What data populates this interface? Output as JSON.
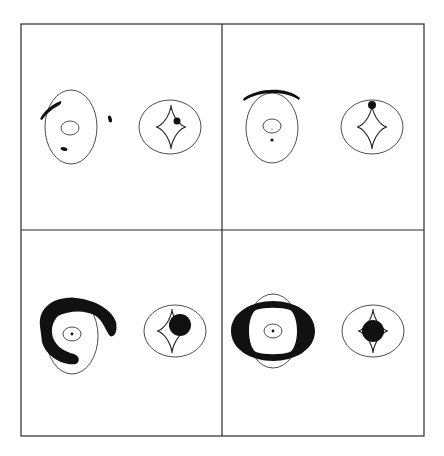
{
  "figure": {
    "type": "lensing-diagram-grid",
    "layout": {
      "rows": 2,
      "cols": 2
    },
    "colors": {
      "ink": "#111111",
      "line": "#3a3a3a",
      "background": "#ffffff"
    },
    "frame": {
      "x": 21,
      "y": 24,
      "width": 403,
      "height": 412,
      "divider_x": 222,
      "divider_y": 230
    },
    "panels": [
      {
        "id": "top-left",
        "image_plane": {
          "critical_curve": {
            "cx": 71,
            "cy": 127,
            "rx": 26,
            "ry": 37
          },
          "inner_curve": {
            "cx": 70,
            "cy": 128,
            "rx": 9,
            "ry": 7
          },
          "images": [
            {
              "shape": "arc",
              "path": "M40,119 C44,111 52,104 61,101 C62,103 60,105 58,106 C52,109 46,114 42,120 Z"
            },
            {
              "shape": "blob",
              "cx": 110,
              "cy": 119,
              "rx": 1.8,
              "ry": 3.5,
              "rotate": -15
            },
            {
              "shape": "blob",
              "cx": 64,
              "cy": 149,
              "rx": 3.5,
              "ry": 1.8,
              "rotate": 15
            }
          ]
        },
        "source_plane": {
          "caustic_ellipse": {
            "cx": 170,
            "cy": 127,
            "rx": 31,
            "ry": 27
          },
          "astroid": {
            "cx": 171,
            "cy": 127,
            "hx": 15,
            "hy": 22
          },
          "source": {
            "cx": 177,
            "cy": 121,
            "r": 3.5
          }
        }
      },
      {
        "id": "top-right",
        "image_plane": {
          "critical_curve": {
            "cx": 272,
            "cy": 128,
            "rx": 26,
            "ry": 35
          },
          "inner_curve": {
            "cx": 272,
            "cy": 126,
            "rx": 9,
            "ry": 7
          },
          "images": [
            {
              "shape": "arc",
              "path": "M243,99 C256,88 286,86 300,98 L299,100 C285,90 258,91 244,101 Z"
            },
            {
              "shape": "blob",
              "cx": 272,
              "cy": 140,
              "rx": 1.6,
              "ry": 1.6,
              "rotate": 0
            },
            {
              "shape": "blob",
              "cx": 272,
              "cy": 129,
              "rx": 0.6,
              "ry": 0.6,
              "rotate": 0
            }
          ]
        },
        "source_plane": {
          "caustic_ellipse": {
            "cx": 372,
            "cy": 127,
            "rx": 31,
            "ry": 27
          },
          "astroid": {
            "cx": 372,
            "cy": 127,
            "hx": 15,
            "hy": 22
          },
          "source": {
            "cx": 372,
            "cy": 105,
            "r": 4
          }
        }
      },
      {
        "id": "bottom-left",
        "image_plane": {
          "critical_curve": {
            "cx": 72,
            "cy": 336,
            "rx": 26,
            "ry": 38
          },
          "inner_curve": {
            "cx": 72,
            "cy": 334,
            "rx": 9,
            "ry": 7
          },
          "images": [
            {
              "shape": "band",
              "path": "M40,326 C38,306 56,296 76,298 C96,300 112,310 116,322 C118,332 114,338 110,336 C106,332 104,322 96,316 C86,310 70,310 58,316 C52,322 50,332 54,340 C58,348 66,352 74,354 C80,356 80,362 76,364 C62,366 46,356 42,342 Z"
            },
            {
              "shape": "blob",
              "cx": 72,
              "cy": 334,
              "rx": 1.4,
              "ry": 1.4,
              "rotate": 0
            }
          ]
        },
        "source_plane": {
          "caustic_ellipse": {
            "cx": 175,
            "cy": 331,
            "rx": 31,
            "ry": 26
          },
          "astroid": {
            "cx": 172,
            "cy": 331,
            "hx": 15,
            "hy": 22
          },
          "source": {
            "cx": 180,
            "cy": 325,
            "r": 11
          }
        }
      },
      {
        "id": "bottom-right",
        "image_plane": {
          "critical_curve": {
            "cx": 273,
            "cy": 331,
            "rx": 26,
            "ry": 37
          },
          "inner_curve": {
            "cx": 273,
            "cy": 331,
            "rx": 9,
            "ry": 7
          },
          "images": [
            {
              "shape": "ring",
              "path": "M231,331 C231,312 252,301 273,301 C294,301 315,312 315,331 C315,350 294,361 273,361 C252,361 231,350 231,331 Z M249,331 C249,341 252,350 256,352 C264,355 282,355 290,352 C294,350 297,341 297,331 C297,321 294,312 290,310 C282,307 264,307 256,310 C252,312 249,321 249,331 Z"
            },
            {
              "shape": "blob",
              "cx": 273,
              "cy": 331,
              "rx": 1.4,
              "ry": 1.4,
              "rotate": 0
            }
          ]
        },
        "source_plane": {
          "caustic_ellipse": {
            "cx": 373,
            "cy": 331,
            "rx": 31,
            "ry": 26
          },
          "astroid": {
            "cx": 373,
            "cy": 331,
            "hx": 15,
            "hy": 22
          },
          "source": {
            "cx": 373,
            "cy": 331,
            "r": 11
          }
        }
      }
    ]
  }
}
